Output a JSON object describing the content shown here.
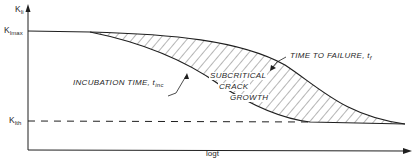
{
  "figure": {
    "y_axis_label": {
      "base": "K",
      "sub": "Ii"
    },
    "x_axis_label": "logt",
    "levels": {
      "kmax": {
        "base": "K",
        "sub": "Imax"
      },
      "kth": {
        "base": "K",
        "sub": "Ith"
      }
    },
    "annotations": {
      "incubation": {
        "text": "INCUBATION TIME, t",
        "sub": "inc"
      },
      "failure": {
        "text": "TIME TO FAILURE, t",
        "sub": "f"
      },
      "region": [
        "SUBCRITICAL",
        "CRACK",
        "GROWTH"
      ]
    },
    "colors": {
      "ink": "#1f1f1f",
      "background": "#ffffff"
    }
  }
}
